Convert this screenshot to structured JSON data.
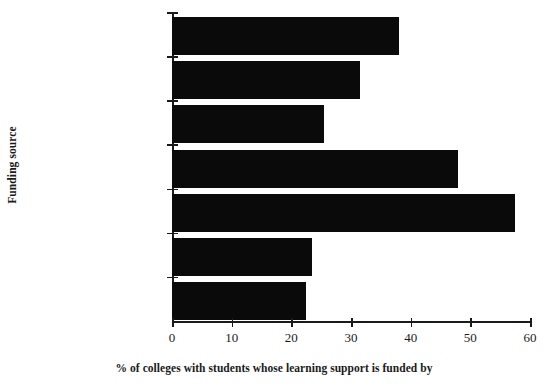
{
  "chart_data": {
    "type": "bar",
    "orientation": "horizontal",
    "title": "",
    "xlabel": "% of colleges with students whose learning support is funded by",
    "ylabel": "Funding source",
    "categories": [
      "TEC",
      "Social Services",
      "Other",
      "LEA",
      "Internal institution\nbudget",
      "HA",
      "ESF"
    ],
    "values": [
      38,
      31.5,
      25.5,
      48,
      57.5,
      23.5,
      22.5
    ],
    "xlim": [
      0,
      60
    ],
    "xticks": [
      0,
      10,
      20,
      30,
      40,
      50,
      60
    ],
    "xtick_labels": [
      "0",
      "10",
      "20",
      "30",
      "40",
      "50",
      "60"
    ],
    "grid": false,
    "legend": "none",
    "bar_color": "#0a0a0a"
  }
}
